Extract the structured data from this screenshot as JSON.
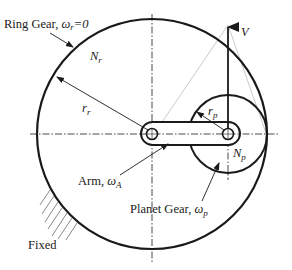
{
  "diagram": {
    "labels": {
      "ring_gear": "Ring Gear, ",
      "ring_omega": "ω",
      "ring_omega_sub": "r",
      "ring_omega_value": "=0",
      "ring_teeth": "N",
      "ring_teeth_sub": "r",
      "ring_radius": "r",
      "ring_radius_sub": "r",
      "velocity": "V",
      "planet_radius": "r",
      "planet_radius_sub": "p",
      "planet_teeth": "N",
      "planet_teeth_sub": "p",
      "arm": "Arm, ",
      "arm_omega": "ω",
      "arm_omega_sub": "A",
      "planet_gear": "Planet Gear, ",
      "planet_omega": "ω",
      "planet_omega_sub": "p",
      "fixed": "Fixed"
    },
    "geometry": {
      "ring_center": [
        152,
        134
      ],
      "ring_radius": 115,
      "planet_center": [
        228,
        134
      ],
      "planet_radius": 39,
      "velocity_tip": [
        228,
        25
      ],
      "contact_point": [
        267,
        134
      ]
    },
    "colors": {
      "stroke": "#1a1a1a",
      "construction": "#9a9a9a",
      "background": "#ffffff"
    }
  }
}
